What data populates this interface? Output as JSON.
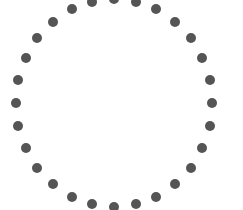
{
  "canvas": {
    "width": 243,
    "height": 210,
    "background_color": "#ffffff"
  },
  "graphic": {
    "name": "dotted-circle-spinner",
    "description": "Ring of evenly spaced dark gray circular dots forming a circle",
    "dot_color": "#555555",
    "dot_count": 28,
    "dot_diameter": 10,
    "center_x": 114,
    "center_y": 103,
    "radius_x": 98,
    "radius_y": 104,
    "start_angle_deg": -90,
    "clipped_edges": [
      "top"
    ]
  },
  "chart_data": {
    "type": "scatter",
    "title": "",
    "xlabel": "",
    "ylabel": "",
    "xlim": [
      0,
      243
    ],
    "ylim": [
      0,
      210
    ],
    "grid": false,
    "legend": "none",
    "series": [
      {
        "name": "ring-dots",
        "color": "#555555",
        "marker": "circle",
        "marker_size": 10,
        "points": [
          {
            "i": 0,
            "angle_deg": -90.0,
            "x": 114,
            "y": -1
          },
          {
            "i": 1,
            "angle_deg": -77.1,
            "x": 136,
            "y": 2
          },
          {
            "i": 2,
            "angle_deg": -64.3,
            "x": 156,
            "y": 9
          },
          {
            "i": 3,
            "angle_deg": -51.4,
            "x": 175,
            "y": 22
          },
          {
            "i": 4,
            "angle_deg": -38.6,
            "x": 191,
            "y": 38
          },
          {
            "i": 5,
            "angle_deg": -25.7,
            "x": 202,
            "y": 58
          },
          {
            "i": 6,
            "angle_deg": -12.9,
            "x": 210,
            "y": 80
          },
          {
            "i": 7,
            "angle_deg": 0.0,
            "x": 212,
            "y": 103
          },
          {
            "i": 8,
            "angle_deg": 12.9,
            "x": 210,
            "y": 126
          },
          {
            "i": 9,
            "angle_deg": 25.7,
            "x": 202,
            "y": 148
          },
          {
            "i": 10,
            "angle_deg": 38.6,
            "x": 191,
            "y": 168
          },
          {
            "i": 11,
            "angle_deg": 51.4,
            "x": 175,
            "y": 184
          },
          {
            "i": 12,
            "angle_deg": 64.3,
            "x": 156,
            "y": 197
          },
          {
            "i": 13,
            "angle_deg": 77.1,
            "x": 136,
            "y": 204
          },
          {
            "i": 14,
            "angle_deg": 90.0,
            "x": 114,
            "y": 207
          },
          {
            "i": 15,
            "angle_deg": 102.9,
            "x": 92,
            "y": 204
          },
          {
            "i": 16,
            "angle_deg": 115.7,
            "x": 72,
            "y": 197
          },
          {
            "i": 17,
            "angle_deg": 128.6,
            "x": 53,
            "y": 184
          },
          {
            "i": 18,
            "angle_deg": 141.4,
            "x": 37,
            "y": 168
          },
          {
            "i": 19,
            "angle_deg": 154.3,
            "x": 26,
            "y": 148
          },
          {
            "i": 20,
            "angle_deg": 167.1,
            "x": 18,
            "y": 126
          },
          {
            "i": 21,
            "angle_deg": 180.0,
            "x": 16,
            "y": 103
          },
          {
            "i": 22,
            "angle_deg": 192.9,
            "x": 18,
            "y": 80
          },
          {
            "i": 23,
            "angle_deg": 205.7,
            "x": 26,
            "y": 58
          },
          {
            "i": 24,
            "angle_deg": 218.6,
            "x": 37,
            "y": 38
          },
          {
            "i": 25,
            "angle_deg": 231.4,
            "x": 53,
            "y": 22
          },
          {
            "i": 26,
            "angle_deg": 244.3,
            "x": 72,
            "y": 9
          },
          {
            "i": 27,
            "angle_deg": 257.1,
            "x": 92,
            "y": 2
          }
        ]
      }
    ]
  }
}
